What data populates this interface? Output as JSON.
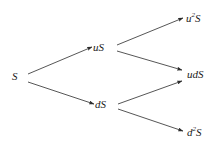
{
  "diagram": {
    "type": "binomial-tree",
    "periods": 2,
    "stroke_color": "#2b2b2b",
    "background_color": "#ffffff",
    "nodes": [
      {
        "id": "root",
        "label_base": "S",
        "label_sup": "",
        "label_text": "S",
        "level": 0,
        "x": 16,
        "y": 77
      },
      {
        "id": "up",
        "label_base": "uS",
        "label_sup": "",
        "label_text": "uS",
        "level": 1,
        "x": 101,
        "y": 48
      },
      {
        "id": "down",
        "label_base": "dS",
        "label_sup": "",
        "label_text": "dS",
        "level": 1,
        "x": 103,
        "y": 105
      },
      {
        "id": "upup",
        "label_base": "u",
        "label_sup": "2",
        "label_tail": "S",
        "label_text": "u2S",
        "level": 2,
        "x": 196,
        "y": 19
      },
      {
        "id": "updown",
        "label_base": "udS",
        "label_sup": "",
        "label_tail": "",
        "label_text": "udS",
        "level": 2,
        "x": 198,
        "y": 75
      },
      {
        "id": "downdown",
        "label_base": "d",
        "label_sup": "2",
        "label_tail": "S",
        "label_text": "d2S",
        "level": 2,
        "x": 197,
        "y": 133
      }
    ],
    "edges": [
      {
        "id": "edge-root-up",
        "from": "root",
        "to": "up",
        "x1": 28,
        "y1": 74,
        "x2": 92,
        "y2": 47
      },
      {
        "id": "edge-root-down",
        "from": "root",
        "to": "down",
        "x1": 28,
        "y1": 82,
        "x2": 94,
        "y2": 104
      },
      {
        "id": "edge-up-upup",
        "from": "up",
        "to": "upup",
        "x1": 117,
        "y1": 45,
        "x2": 183,
        "y2": 18
      },
      {
        "id": "edge-up-updown",
        "from": "up",
        "to": "updown",
        "x1": 117,
        "y1": 51,
        "x2": 182,
        "y2": 70
      },
      {
        "id": "edge-down-updown",
        "from": "down",
        "to": "updown",
        "x1": 118,
        "y1": 104,
        "x2": 182,
        "y2": 81
      },
      {
        "id": "edge-down-downdown",
        "from": "down",
        "to": "downdown",
        "x1": 118,
        "y1": 109,
        "x2": 183,
        "y2": 131
      }
    ]
  }
}
